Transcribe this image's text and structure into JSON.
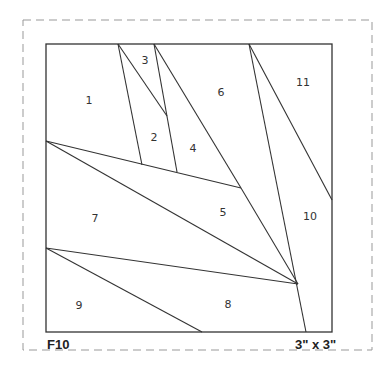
{
  "pattern": {
    "id": "F10",
    "size": "3\" x 3\"",
    "pieces": [
      {
        "n": "1",
        "x": 89,
        "y": 100
      },
      {
        "n": "2",
        "x": 154,
        "y": 137
      },
      {
        "n": "3",
        "x": 145,
        "y": 60
      },
      {
        "n": "4",
        "x": 193,
        "y": 148
      },
      {
        "n": "5",
        "x": 223,
        "y": 212
      },
      {
        "n": "6",
        "x": 221,
        "y": 92
      },
      {
        "n": "7",
        "x": 95,
        "y": 218
      },
      {
        "n": "8",
        "x": 228,
        "y": 304
      },
      {
        "n": "9",
        "x": 79,
        "y": 305
      },
      {
        "n": "10",
        "x": 310,
        "y": 216
      },
      {
        "n": "11",
        "x": 303,
        "y": 82
      }
    ]
  },
  "colors": {
    "line": "#333333",
    "dash": "#999999"
  }
}
